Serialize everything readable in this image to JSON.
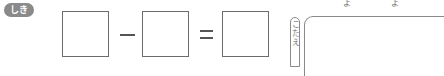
{
  "badge": {
    "label": "しき"
  },
  "equation": {
    "operand1": "",
    "operator1": "−",
    "operand2": "",
    "operator2": "=",
    "result": ""
  },
  "answer": {
    "label": "こたえ",
    "value": ""
  },
  "top_fragments": [
    "よ",
    "よ"
  ]
}
